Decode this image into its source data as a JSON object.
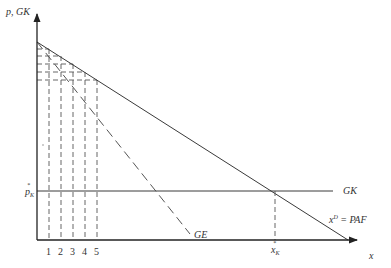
{
  "diagram": {
    "type": "economics-demand-diagram",
    "axes": {
      "y_label": "p, GK",
      "x_label": "x",
      "y_tick_label_main": "p",
      "y_tick_label_sub": "K",
      "y_tick_label_sup": "*",
      "x_tick_label_main": "x",
      "x_tick_label_sub": "K",
      "x_tick_label_sup": "*"
    },
    "quantity_ticks": [
      "1",
      "2",
      "3",
      "4",
      "5"
    ],
    "curves": {
      "demand": {
        "label": "x",
        "label_sup": "D",
        "label_rest": " = PAF",
        "style": "solid"
      },
      "marginal_revenue": {
        "label": "GE",
        "style": "dashed"
      },
      "marginal_cost": {
        "label": "GK",
        "style": "solid"
      }
    },
    "colors": {
      "line": "#3a3a3a",
      "dashed": "#555555",
      "text": "#333333",
      "background": "#ffffff"
    }
  }
}
